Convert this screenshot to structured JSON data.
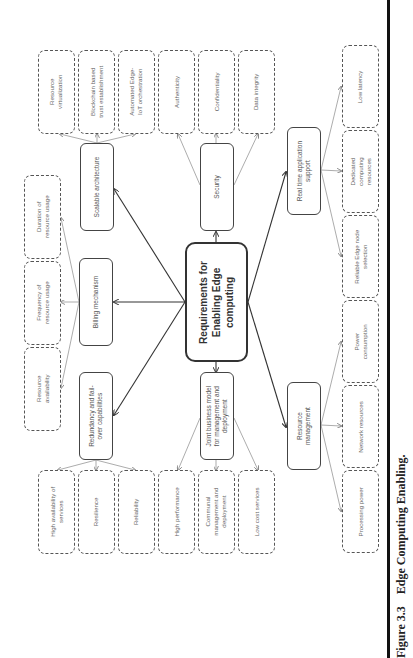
{
  "center": {
    "label": "Requirements for\nEnabling Edge\ncomputing"
  },
  "categories": [
    {
      "id": "scalable",
      "label": "Scalable architecture",
      "children": [
        "Resource\nvirtualization",
        "Blockchain based\ntrust establishment",
        "Automated Edge-\nIoT orchestration"
      ]
    },
    {
      "id": "billing",
      "label": "Billing mechanism",
      "children": [
        "Duration of\nresource usage",
        "Frequency of\nresource usage",
        "Resource\navailability"
      ]
    },
    {
      "id": "redundancy",
      "label": "Redundancy and fail-\nover capabilities",
      "children": [
        "High availability of\nservices",
        "Resilience",
        "Reliability"
      ]
    },
    {
      "id": "security",
      "label": "Security",
      "children": [
        "Authenticity",
        "Confidentiality",
        "Data integrity"
      ]
    },
    {
      "id": "joint",
      "label": "Joint business model\nfor management and\ndeployment",
      "children": [
        "High performance",
        "Communal\nmanagement and\ndeployment",
        "Low cost services"
      ]
    },
    {
      "id": "realtime",
      "label": "Real time application\nsupport",
      "children": [
        "Low latency",
        "Dedicated\ncomputing\nresources",
        "Reliable Edge node\nselection"
      ]
    },
    {
      "id": "resource",
      "label": "Resource\nmanagement",
      "children": [
        "Power\nconsumption",
        "Network resources",
        "Processing power"
      ]
    }
  ],
  "caption": {
    "figure": "Figure 3.3",
    "title": "Edge Computing Enabling."
  }
}
